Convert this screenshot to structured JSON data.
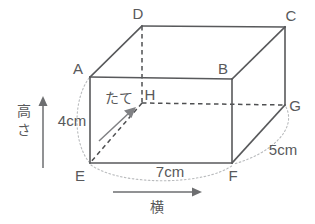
{
  "figure": {
    "shape": "rectangular-cuboid",
    "colors": {
      "edge": "#58595b",
      "hidden_edge": "#4f5052",
      "guide_arc": "#b9bbbd",
      "arrow": "#6d6e70",
      "background": "#ffffff"
    },
    "vertices": [
      {
        "id": "A",
        "label": "A",
        "x": 90,
        "y": 77,
        "hidden": false,
        "label_x": 78,
        "label_y": 70
      },
      {
        "id": "B",
        "label": "B",
        "x": 232,
        "y": 79,
        "hidden": false,
        "label_x": 223,
        "label_y": 70
      },
      {
        "id": "C",
        "label": "C",
        "x": 285,
        "y": 27,
        "hidden": false,
        "label_x": 288,
        "label_y": 17
      },
      {
        "id": "D",
        "label": "D",
        "x": 142,
        "y": 26,
        "hidden": false,
        "label_x": 137,
        "label_y": 15
      },
      {
        "id": "E",
        "label": "E",
        "x": 90,
        "y": 163,
        "hidden": false,
        "label_x": 79,
        "label_y": 177
      },
      {
        "id": "F",
        "label": "F",
        "x": 232,
        "y": 163,
        "hidden": false,
        "label_x": 231,
        "label_y": 177
      },
      {
        "id": "G",
        "label": "G",
        "x": 285,
        "y": 105,
        "hidden": false,
        "label_x": 290,
        "label_y": 107
      },
      {
        "id": "H",
        "label": "H",
        "x": 142,
        "y": 103,
        "hidden": true,
        "label_x": 146,
        "label_y": 96
      }
    ],
    "edges_solid": [
      {
        "from": "A",
        "to": "B"
      },
      {
        "from": "B",
        "to": "F"
      },
      {
        "from": "F",
        "to": "E"
      },
      {
        "from": "E",
        "to": "A"
      },
      {
        "from": "A",
        "to": "D"
      },
      {
        "from": "B",
        "to": "C"
      },
      {
        "from": "D",
        "to": "C"
      },
      {
        "from": "C",
        "to": "G"
      },
      {
        "from": "G",
        "to": "F"
      }
    ],
    "edges_hidden": [
      {
        "from": "D",
        "to": "H"
      },
      {
        "from": "H",
        "to": "G"
      },
      {
        "from": "H",
        "to": "E"
      }
    ],
    "dimensions": [
      {
        "id": "height",
        "value": "4cm",
        "axis_label": "高さ",
        "x": 72,
        "y": 122
      },
      {
        "id": "width",
        "value": "7cm",
        "axis_label": "横",
        "x": 170,
        "y": 173
      },
      {
        "id": "depth",
        "value": "5cm",
        "axis_label": "たて",
        "x": 283,
        "y": 151
      }
    ],
    "axis_arrows": {
      "height": {
        "label": "高さ",
        "label_x": 24,
        "label_y": 122,
        "x": 43,
        "from_y": 168,
        "to_y": 98
      },
      "width": {
        "label": "横",
        "label_x": 156,
        "label_y": 208,
        "y": 192,
        "from_x": 113,
        "to_x": 200
      },
      "depth": {
        "label": "たて",
        "label_x": 118,
        "label_y": 99
      }
    },
    "guide_arcs": [
      {
        "id": "arc-left",
        "d": "M 89 78 C 73 100, 73 142, 89 162"
      },
      {
        "id": "arc-bottom",
        "d": "M 91 165 C 120 186, 205 186, 233 165"
      },
      {
        "id": "arc-right",
        "d": "M 286 107 C 296 128, 272 152, 234 164"
      }
    ]
  }
}
